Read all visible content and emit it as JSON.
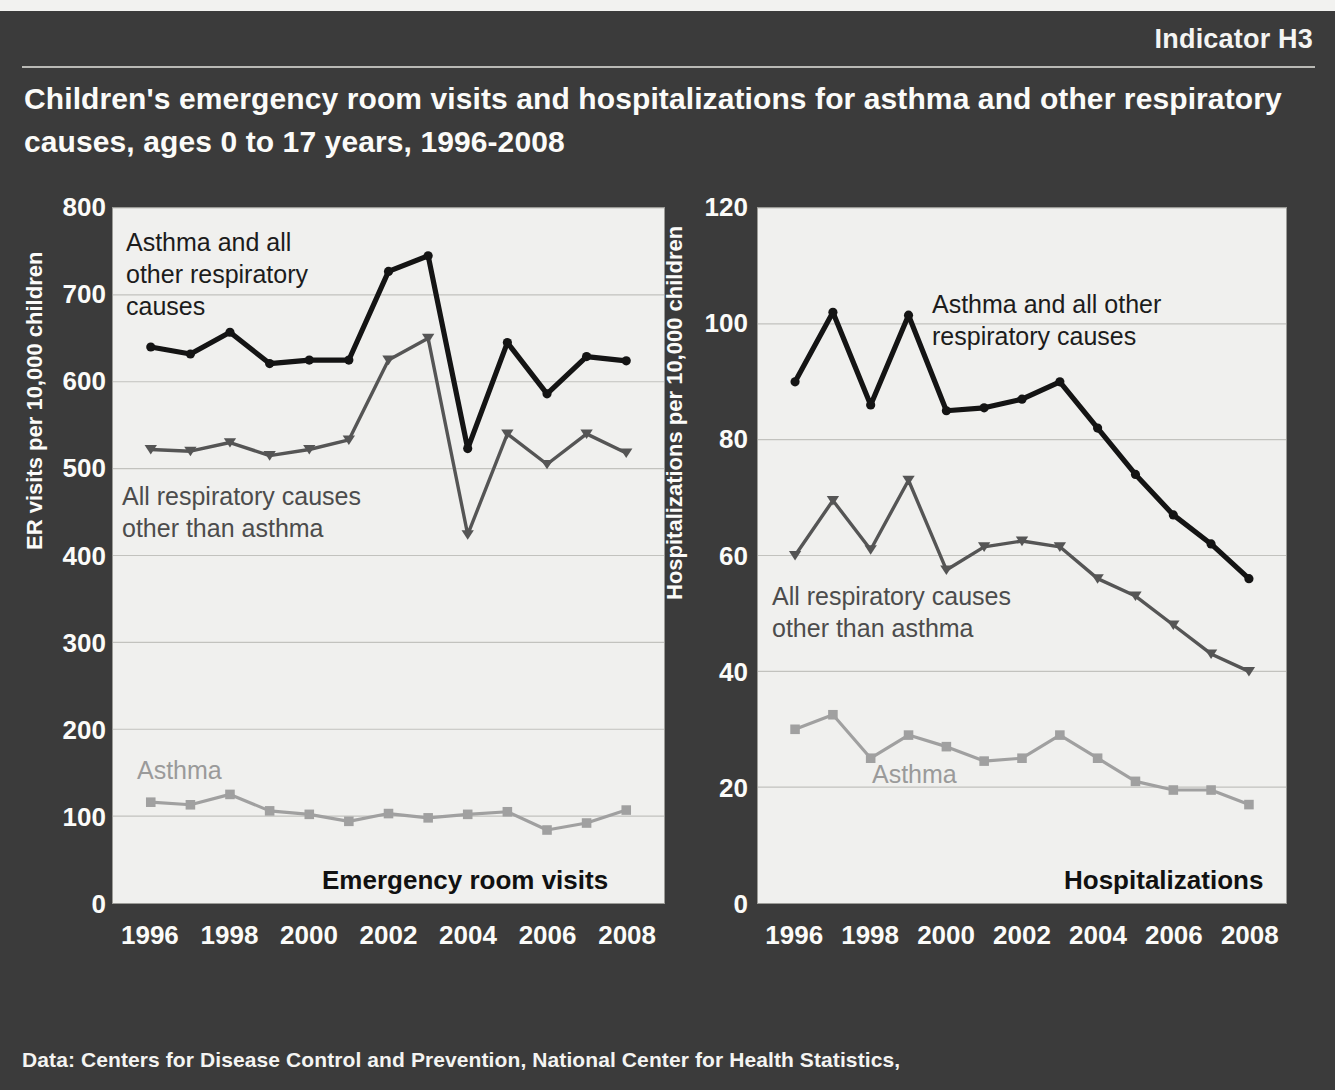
{
  "header": {
    "indicator": "Indicator H3",
    "title": "Children's emergency room visits and hospitalizations for asthma and other respiratory causes, ages 0 to 17 years, 1996-2008"
  },
  "footer": {
    "source": "Data: Centers for Disease Control and Prevention, National Center for Health Statistics,"
  },
  "colors": {
    "background": "#3b3b3b",
    "plot_background": "#f0f0ee",
    "text_light": "#fbfbf9",
    "series_total": "#141414",
    "series_other": "#555555",
    "series_asthma": "#a0a0a0",
    "gridline": "#c2c2be"
  },
  "chart_data": [
    {
      "type": "line",
      "title": "Emergency room visits",
      "xlabel": "",
      "ylabel": "ER visits per 10,000 children",
      "x": [
        1996,
        1997,
        1998,
        1999,
        2000,
        2001,
        2002,
        2003,
        2004,
        2005,
        2006,
        2007,
        2008
      ],
      "xticks": [
        1996,
        1998,
        2000,
        2002,
        2004,
        2006,
        2008
      ],
      "yticks": [
        0,
        100,
        200,
        300,
        400,
        500,
        600,
        700,
        800
      ],
      "xlim": [
        1996,
        2008
      ],
      "ylim": [
        0,
        800
      ],
      "grid": true,
      "legend_position": "in-plot annotations",
      "series": [
        {
          "name": "Asthma and all other respiratory causes",
          "color": "#141414",
          "marker": "circle",
          "values": [
            640,
            632,
            657,
            621,
            625,
            625,
            727,
            745,
            523,
            645,
            586,
            629,
            624
          ]
        },
        {
          "name": "All respiratory causes other than asthma",
          "color": "#555555",
          "marker": "triangle-down",
          "values": [
            522,
            520,
            530,
            515,
            522,
            533,
            625,
            650,
            424,
            540,
            505,
            540,
            518
          ]
        },
        {
          "name": "Asthma",
          "color": "#a0a0a0",
          "marker": "square",
          "values": [
            116,
            113,
            125,
            106,
            102,
            94,
            103,
            98,
            102,
            105,
            84,
            92,
            107
          ]
        }
      ],
      "annotations": [
        "Asthma and all\nother respiratory\ncauses",
        "All respiratory causes\nother than asthma",
        "Asthma"
      ]
    },
    {
      "type": "line",
      "title": "Hospitalizations",
      "xlabel": "",
      "ylabel": "Hospitalizations per 10,000 children",
      "x": [
        1996,
        1997,
        1998,
        1999,
        2000,
        2001,
        2002,
        2003,
        2004,
        2005,
        2006,
        2007,
        2008
      ],
      "xticks": [
        1996,
        1998,
        2000,
        2002,
        2004,
        2006,
        2008
      ],
      "yticks": [
        0,
        20,
        40,
        60,
        80,
        100,
        120
      ],
      "xlim": [
        1996,
        2008
      ],
      "ylim": [
        0,
        120
      ],
      "grid": true,
      "legend_position": "in-plot annotations",
      "series": [
        {
          "name": "Asthma and all other respiratory causes",
          "color": "#141414",
          "marker": "circle",
          "values": [
            90,
            102,
            86,
            101.5,
            85,
            85.5,
            87,
            90,
            82,
            74,
            67,
            62,
            56
          ]
        },
        {
          "name": "All respiratory causes other than asthma",
          "color": "#555555",
          "marker": "triangle-down",
          "values": [
            60,
            69.5,
            61,
            73,
            57.5,
            61.5,
            62.5,
            61.5,
            56,
            53,
            48,
            43,
            40
          ]
        },
        {
          "name": "Asthma",
          "color": "#a0a0a0",
          "marker": "square",
          "values": [
            30,
            32.5,
            25,
            29,
            27,
            24.5,
            25,
            29,
            25,
            21,
            19.5,
            19.5,
            17
          ]
        }
      ],
      "annotations": [
        "Asthma and all other\nrespiratory causes",
        "All respiratory causes\nother than asthma",
        "Asthma"
      ]
    }
  ]
}
